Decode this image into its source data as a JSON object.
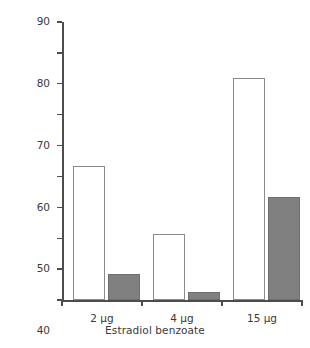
{
  "chart_data": {
    "type": "bar",
    "title": "",
    "subtitle": "",
    "xlabel": "Estradiol benzoate",
    "ylabel": "Rats becoming diabetic (%)",
    "categories": [
      "2 µg",
      "4 µg",
      "15 µg"
    ],
    "series": [
      {
        "name": "open",
        "color": "#ffffff",
        "values": [
          43.5,
          21.5,
          72.0
        ]
      },
      {
        "name": "filled",
        "color": "#808080",
        "values": [
          8.3,
          2.6,
          33.5
        ]
      }
    ],
    "ylim": [
      0,
      90
    ],
    "yticks": [
      0,
      10,
      20,
      30,
      40,
      50,
      60,
      70,
      80,
      90
    ],
    "ytick_labels": [
      "0",
      "10",
      "20",
      "30",
      "40",
      "50",
      "60",
      "70",
      "80",
      "90"
    ],
    "grid": false,
    "legend": "none"
  }
}
